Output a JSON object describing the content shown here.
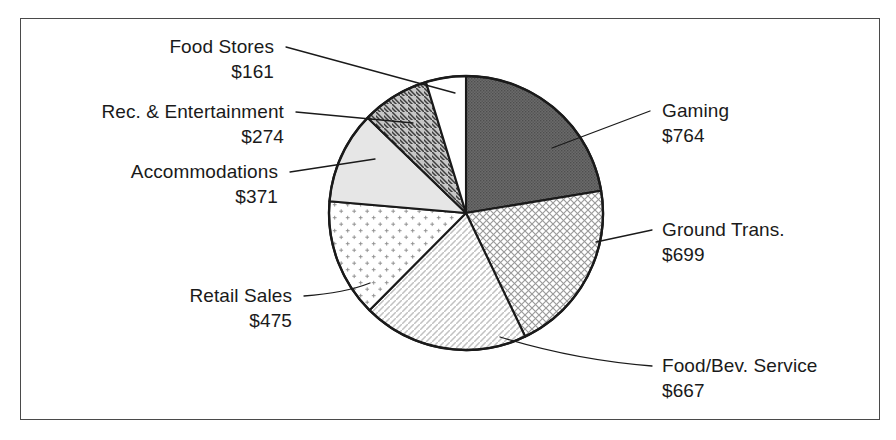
{
  "chart_data": {
    "type": "pie",
    "title": "",
    "subtitle": "",
    "xlabel": "",
    "ylabel": "",
    "legend_position": "none",
    "grid": false,
    "value_prefix": "$",
    "total": 3411,
    "units": "millions of dollars",
    "categories": [
      "Gaming",
      "Ground Trans.",
      "Food/Bev. Service",
      "Retail Sales",
      "Accommodations",
      "Rec. & Entertainment",
      "Food Stores"
    ],
    "values": [
      764,
      699,
      667,
      475,
      371,
      274,
      161
    ],
    "slices": [
      {
        "label": "Gaming",
        "value": 764,
        "value_text": "$764",
        "percent": 22.4,
        "start_angle": 0.0,
        "end_angle": 80.6,
        "fill": "dark-gray-dots",
        "color": "#636363"
      },
      {
        "label": "Ground Trans.",
        "value": 699,
        "value_text": "$699",
        "percent": 20.5,
        "start_angle": 80.6,
        "end_angle": 154.4,
        "fill": "crosshatch",
        "color": "#ffffff"
      },
      {
        "label": "Food/Bev. Service",
        "value": 667,
        "value_text": "$667",
        "percent": 19.6,
        "start_angle": 154.4,
        "end_angle": 224.8,
        "fill": "diagonal-hatch-light",
        "color": "#ffffff"
      },
      {
        "label": "Retail Sales",
        "value": 475,
        "value_text": "$475",
        "percent": 13.9,
        "start_angle": 224.8,
        "end_angle": 274.9,
        "fill": "plus-dots",
        "color": "#ffffff"
      },
      {
        "label": "Accommodations",
        "value": 371,
        "value_text": "$371",
        "percent": 10.9,
        "start_angle": 274.9,
        "end_angle": 314.1,
        "fill": "light-gray-solid",
        "color": "#e4e4e4"
      },
      {
        "label": "Rec. & Entertainment",
        "value": 274,
        "value_text": "$274",
        "percent": 8.0,
        "start_angle": 314.1,
        "end_angle": 343.0,
        "fill": "gray-diagonal-stripes",
        "color": "#c9c9c9"
      },
      {
        "label": "Food Stores",
        "value": 161,
        "value_text": "$161",
        "percent": 4.7,
        "start_angle": 343.0,
        "end_angle": 360.0,
        "fill": "white-solid",
        "color": "#ffffff"
      }
    ]
  },
  "labels": {
    "food_stores": {
      "name": "Food Stores",
      "value": "$161"
    },
    "rec_entertainment": {
      "name": "Rec. & Entertainment",
      "value": "$274"
    },
    "accommodations": {
      "name": "Accommodations",
      "value": "$371"
    },
    "retail_sales": {
      "name": "Retail Sales",
      "value": "$475"
    },
    "gaming": {
      "name": "Gaming",
      "value": "$764"
    },
    "ground_trans": {
      "name": "Ground Trans.",
      "value": "$699"
    },
    "food_bev_service": {
      "name": "Food/Bev. Service",
      "value": "$667"
    }
  },
  "colors": {
    "outline": "#1a1a1a",
    "frame": "#4a4a4a",
    "text": "#1a1a1a",
    "background": "#ffffff",
    "gaming_fill": "#636363",
    "accommodations_fill": "#e4e4e4",
    "rec_fill": "#c9c9c9"
  }
}
